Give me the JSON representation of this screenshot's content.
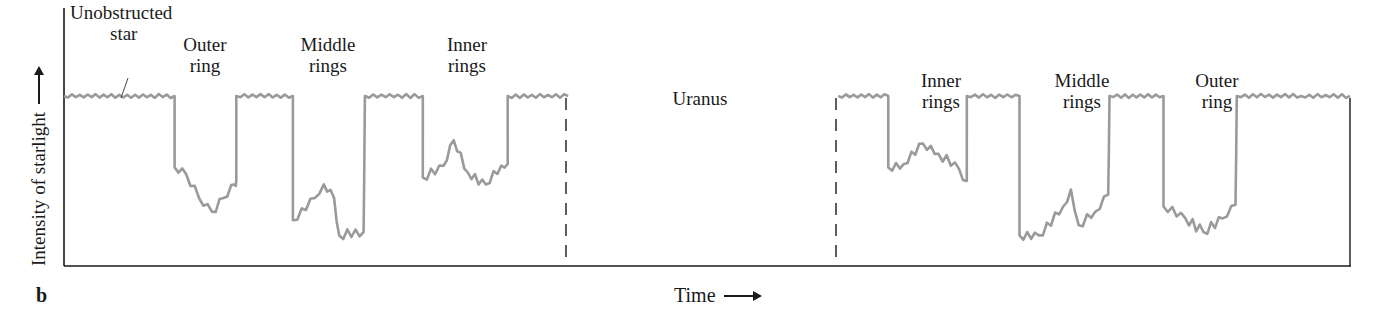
{
  "figure": {
    "panel_label": "b",
    "ylabel": "Intensity of starlight",
    "xlabel": "Time",
    "annotations": {
      "unobstructed_line1": "Unobstructed",
      "unobstructed_line2": "star",
      "outer_left_1": "Outer",
      "outer_left_2": "ring",
      "middle_left_1": "Middle",
      "middle_left_2": "rings",
      "inner_left_1": "Inner",
      "inner_left_2": "rings",
      "uranus": "Uranus",
      "inner_right_1": "Inner",
      "inner_right_2": "rings",
      "middle_right_1": "Middle",
      "middle_right_2": "rings",
      "outer_right_1": "Outer",
      "outer_right_2": "ring"
    },
    "colors": {
      "signal": "#9a9a9a",
      "axis": "#1a1a1a",
      "background": "#ffffff"
    }
  },
  "chart_data": {
    "type": "line",
    "title": "",
    "xlabel": "Time",
    "ylabel": "Intensity of starlight",
    "grid": false,
    "legend": null,
    "axis_ranges": {
      "x": [
        0,
        100
      ],
      "y": [
        0,
        100
      ]
    },
    "note": "Schematic light curve of a star occulted by Uranus' rings; values are relative (0 = no light, 100 = unobstructed star). x in percent of plot width.",
    "series": [
      {
        "name": "Starlight intensity (before Uranus)",
        "points": [
          [
            0,
            100
          ],
          [
            8.6,
            100
          ],
          [
            8.6,
            58
          ],
          [
            9.5,
            54
          ],
          [
            10.5,
            40
          ],
          [
            11.5,
            32
          ],
          [
            12.4,
            40
          ],
          [
            13.3,
            48
          ],
          [
            13.4,
            50
          ],
          [
            13.4,
            100
          ],
          [
            17.8,
            100
          ],
          [
            17.8,
            27
          ],
          [
            19.5,
            40
          ],
          [
            20.2,
            48
          ],
          [
            21.0,
            40
          ],
          [
            21.4,
            18
          ],
          [
            23.3,
            20
          ],
          [
            23.4,
            100
          ],
          [
            27.9,
            100
          ],
          [
            27.9,
            52
          ],
          [
            29.5,
            59
          ],
          [
            30.3,
            74
          ],
          [
            31.4,
            55
          ],
          [
            32.8,
            48
          ],
          [
            34.0,
            59
          ],
          [
            34.5,
            60
          ],
          [
            34.5,
            100
          ],
          [
            39.2,
            100
          ]
        ]
      },
      {
        "name": "Starlight intensity (after Uranus)",
        "points": [
          [
            60.2,
            100
          ],
          [
            64.1,
            100
          ],
          [
            64.1,
            58
          ],
          [
            65.3,
            60
          ],
          [
            66.8,
            72
          ],
          [
            68.0,
            66
          ],
          [
            69.6,
            57
          ],
          [
            70.2,
            50
          ],
          [
            70.2,
            100
          ],
          [
            74.3,
            100
          ],
          [
            74.3,
            18
          ],
          [
            75.8,
            18
          ],
          [
            77.7,
            35
          ],
          [
            78.3,
            45
          ],
          [
            78.9,
            24
          ],
          [
            80.2,
            32
          ],
          [
            81.2,
            42
          ],
          [
            81.3,
            100
          ],
          [
            85.5,
            100
          ],
          [
            85.5,
            35
          ],
          [
            87.2,
            28
          ],
          [
            88.6,
            20
          ],
          [
            90.1,
            28
          ],
          [
            91.1,
            36
          ],
          [
            91.2,
            100
          ],
          [
            96.2,
            100
          ],
          [
            100,
            100
          ]
        ]
      }
    ],
    "events": [
      {
        "label": "Outer ring",
        "side": "ingress",
        "x_center": 11
      },
      {
        "label": "Middle rings",
        "side": "ingress",
        "x_center": 20.6
      },
      {
        "label": "Inner rings",
        "side": "ingress",
        "x_center": 31.2
      },
      {
        "label": "Uranus",
        "x_range": [
          39.2,
          60.2
        ],
        "marker": "dashed vertical lines"
      },
      {
        "label": "Inner rings",
        "side": "egress",
        "x_center": 67.2
      },
      {
        "label": "Middle rings",
        "side": "egress",
        "x_center": 77.8
      },
      {
        "label": "Outer ring",
        "side": "egress",
        "x_center": 88.3
      }
    ],
    "annotations": [
      "Unobstructed star"
    ]
  }
}
